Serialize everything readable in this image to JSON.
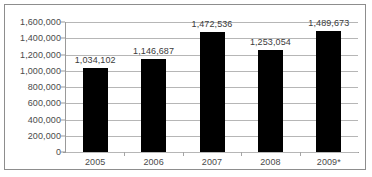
{
  "chart_data": {
    "type": "bar",
    "title": "",
    "subtitle": "",
    "xlabel": "",
    "ylabel": "",
    "categories": [
      "2005",
      "2006",
      "2007",
      "2008",
      "2009*"
    ],
    "values": [
      1034102,
      1146687,
      1472536,
      1253054,
      1489673
    ],
    "value_labels": [
      "1,034,102",
      "1,146,687",
      "1,472,536",
      "1,253,054",
      "1,489,673"
    ],
    "ylim": [
      0,
      1600000
    ],
    "ytick_values": [
      1600000,
      1400000,
      1200000,
      1000000,
      800000,
      600000,
      400000,
      200000,
      0
    ],
    "ytick_labels": [
      "1,600,000",
      "1,400,000",
      "1,200,000",
      "1,000,000",
      "800,000",
      "600,000",
      "400,000",
      "200,000",
      "0"
    ],
    "grid": true,
    "legend": "none",
    "series": [
      {
        "name": "",
        "values": [
          1034102,
          1146687,
          1472536,
          1253054,
          1489673
        ]
      }
    ],
    "colors": {
      "bar": "#000000",
      "gridline": "#b6b6b6",
      "axis": "#9a9a9a",
      "border": "#8d8d8d",
      "label_text": "#4a4a4a",
      "background": "#ffffff"
    }
  }
}
